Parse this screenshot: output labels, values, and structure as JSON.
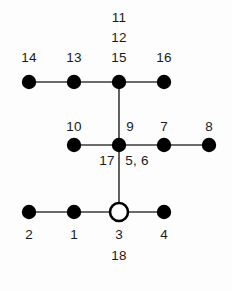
{
  "figure": {
    "type": "node-edge-diagram",
    "background_color": "#fdfdfd",
    "node_fill_color": "#000000",
    "edge_color": "#3a3a3a",
    "label_color": "#1a1a1a"
  },
  "chart_data": {
    "type": "scatter",
    "title": "",
    "xlabel": "",
    "ylabel": "",
    "grid": false,
    "legend": "none",
    "nodes": [
      {
        "id": "n14",
        "x": 29,
        "y": 82,
        "style": "filled",
        "label": "14",
        "label_x": 29,
        "label_y": 58
      },
      {
        "id": "n13",
        "x": 74,
        "y": 82,
        "style": "filled",
        "label": "13",
        "label_x": 74,
        "label_y": 58
      },
      {
        "id": "n15",
        "x": 119,
        "y": 82,
        "style": "filled",
        "label": "15",
        "label_x": 119,
        "label_y": 58
      },
      {
        "id": "n16",
        "x": 164,
        "y": 82,
        "style": "filled",
        "label": "16",
        "label_x": 164,
        "label_y": 58
      },
      {
        "id": "n10",
        "x": 74,
        "y": 145,
        "style": "filled",
        "label": "10",
        "label_x": 74,
        "label_y": 127
      },
      {
        "id": "n9",
        "x": 119,
        "y": 145,
        "style": "filled",
        "label": "9",
        "label_x": 130,
        "label_y": 127
      },
      {
        "id": "n7",
        "x": 164,
        "y": 145,
        "style": "filled",
        "label": "7",
        "label_x": 164,
        "label_y": 127
      },
      {
        "id": "n8",
        "x": 209,
        "y": 145,
        "style": "filled",
        "label": "8",
        "label_x": 209,
        "label_y": 127
      },
      {
        "id": "n2",
        "x": 29,
        "y": 212,
        "style": "filled",
        "label": "2",
        "label_x": 29,
        "label_y": 235
      },
      {
        "id": "n1",
        "x": 74,
        "y": 212,
        "style": "filled",
        "label": "1",
        "label_x": 74,
        "label_y": 235
      },
      {
        "id": "n3",
        "x": 119,
        "y": 212,
        "style": "hollow",
        "label": "3",
        "label_x": 119,
        "label_y": 235
      },
      {
        "id": "n4",
        "x": 164,
        "y": 212,
        "style": "filled",
        "label": "4",
        "label_x": 164,
        "label_y": 235
      }
    ],
    "edges": [
      {
        "id": "e14-13",
        "x1": 29,
        "y1": 82,
        "x2": 74,
        "y2": 82
      },
      {
        "id": "e13-15",
        "x1": 74,
        "y1": 82,
        "x2": 119,
        "y2": 82
      },
      {
        "id": "e15-16",
        "x1": 119,
        "y1": 82,
        "x2": 164,
        "y2": 82
      },
      {
        "id": "e15-9",
        "x1": 119,
        "y1": 82,
        "x2": 119,
        "y2": 145
      },
      {
        "id": "e10-9",
        "x1": 74,
        "y1": 145,
        "x2": 119,
        "y2": 145
      },
      {
        "id": "e9-7",
        "x1": 119,
        "y1": 145,
        "x2": 164,
        "y2": 145
      },
      {
        "id": "e7-8",
        "x1": 164,
        "y1": 145,
        "x2": 209,
        "y2": 145
      },
      {
        "id": "e9-3",
        "x1": 119,
        "y1": 145,
        "x2": 119,
        "y2": 212
      },
      {
        "id": "e2-1",
        "x1": 29,
        "y1": 212,
        "x2": 74,
        "y2": 212
      },
      {
        "id": "e1-3",
        "x1": 74,
        "y1": 212,
        "x2": 119,
        "y2": 212
      },
      {
        "id": "e3-4",
        "x1": 119,
        "y1": 212,
        "x2": 164,
        "y2": 212
      }
    ],
    "edge_labels": [
      {
        "id": "l11",
        "text": "11",
        "x": 119,
        "y": 18
      },
      {
        "id": "l12",
        "text": "12",
        "x": 119,
        "y": 38
      },
      {
        "id": "l17",
        "text": "17",
        "x": 107,
        "y": 161
      },
      {
        "id": "l56",
        "text": "5, 6",
        "x": 137,
        "y": 161
      },
      {
        "id": "l18",
        "text": "18",
        "x": 119,
        "y": 256
      }
    ]
  }
}
